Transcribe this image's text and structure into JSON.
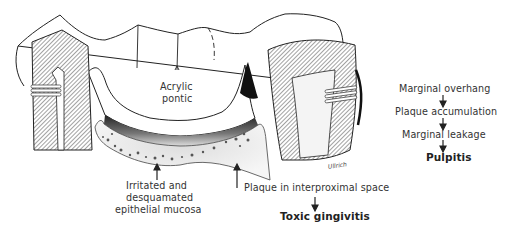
{
  "figure": {
    "type": "dental bridge cross-section illustration",
    "signature": "Ullrich",
    "labels": {
      "pontic_line1": "Acrylic",
      "pontic_line2": "pontic",
      "mucosa_line1": "Irritated and",
      "mucosa_line2": "desquamated",
      "mucosa_line3": "epithelial mucosa",
      "plaque": "Plaque in interproximal space",
      "toxic": "Toxic gingivitis"
    },
    "flow_chain": {
      "steps": [
        "Marginal overhang",
        "Plaque accumulation",
        "Marginal leakage"
      ],
      "result": "Pulpitis"
    }
  }
}
